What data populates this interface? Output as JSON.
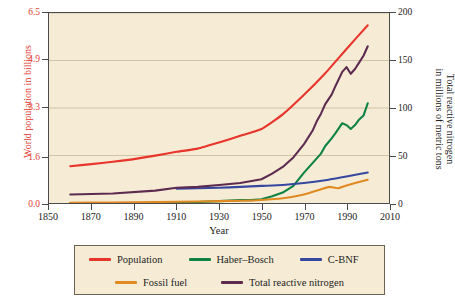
{
  "chart_data": {
    "type": "line",
    "title": "",
    "xlabel": "Year",
    "ylabel_left": "World population in billions",
    "ylabel_right": "Total reactive nitrogen in millions of metric tons",
    "ylabel_right_line1": "Total reactive nitrogen",
    "ylabel_right_line2": "in millions of metric tons",
    "xlim": [
      1850,
      2010
    ],
    "ylim_left": [
      0.0,
      6.5
    ],
    "ylim_right": [
      0,
      200
    ],
    "xticks": [
      1850,
      1870,
      1890,
      1910,
      1930,
      1950,
      1970,
      1990,
      2010
    ],
    "yticks_left": [
      "0.0",
      "1.6",
      "3.3",
      "4.9",
      "6.5"
    ],
    "yticks_left_values": [
      0.0,
      1.6,
      3.3,
      4.9,
      6.5
    ],
    "yticks_right": [
      "0",
      "50",
      "100",
      "150",
      "200"
    ],
    "yticks_right_values": [
      0,
      50,
      100,
      150,
      200
    ],
    "grid": "horizontal",
    "legend_position": "below",
    "plot_background": "#f6ecd6",
    "series": [
      {
        "name": "Population",
        "color": "#e8352b",
        "axis": "left",
        "units": "billions",
        "x": [
          1860,
          1870,
          1880,
          1890,
          1900,
          1910,
          1920,
          1930,
          1940,
          1950,
          1960,
          1970,
          1980,
          1990,
          2000
        ],
        "values": [
          1.26,
          1.33,
          1.41,
          1.5,
          1.62,
          1.75,
          1.86,
          2.07,
          2.3,
          2.53,
          3.03,
          3.7,
          4.44,
          5.27,
          6.08
        ]
      },
      {
        "name": "Haber–Bosch",
        "color": "#0c8243",
        "axis": "right",
        "units": "Mt N",
        "x": [
          1860,
          1900,
          1913,
          1920,
          1930,
          1940,
          1945,
          1950,
          1955,
          1960,
          1965,
          1970,
          1974,
          1978,
          1980,
          1983,
          1985,
          1988,
          1990,
          1992,
          1994,
          1996,
          1998,
          2000
        ],
        "values": [
          0,
          0,
          0.5,
          1,
          2,
          3,
          3,
          4,
          7,
          11,
          18,
          32,
          42,
          52,
          60,
          68,
          74,
          84,
          82,
          78,
          82,
          88,
          92,
          105
        ]
      },
      {
        "name": "C-BNF",
        "color": "#36479f",
        "axis": "right",
        "units": "Mt N",
        "x": [
          1910,
          1920,
          1930,
          1940,
          1950,
          1960,
          1970,
          1980,
          1990,
          2000
        ],
        "values": [
          15,
          15.5,
          16,
          17,
          18,
          19,
          21,
          24,
          28,
          32
        ]
      },
      {
        "name": "Fossil fuel",
        "color": "#e08a21",
        "axis": "right",
        "units": "Mt N",
        "x": [
          1860,
          1880,
          1900,
          1920,
          1940,
          1950,
          1960,
          1970,
          1978,
          1982,
          1986,
          1990,
          2000
        ],
        "values": [
          0.3,
          0.6,
          1.0,
          1.6,
          2.4,
          3.2,
          5.0,
          9.0,
          14.5,
          17.0,
          15.5,
          18.5,
          24.5
        ]
      },
      {
        "name": "Total reactive nitrogen",
        "color": "#5e2b50",
        "axis": "right",
        "units": "Mt N",
        "x": [
          1860,
          1880,
          1900,
          1910,
          1920,
          1930,
          1940,
          1950,
          1955,
          1960,
          1965,
          1970,
          1974,
          1976,
          1978,
          1980,
          1983,
          1985,
          1988,
          1990,
          1992,
          1994,
          1996,
          1998,
          2000
        ],
        "values": [
          9,
          10,
          13,
          16,
          17,
          19,
          21,
          25,
          31,
          38,
          48,
          62,
          76,
          86,
          94,
          104,
          114,
          124,
          138,
          143,
          136,
          141,
          148,
          155,
          165
        ]
      }
    ]
  },
  "legend": {
    "row1": [
      {
        "label": "Population",
        "color": "#e8352b"
      },
      {
        "label": "Haber–Bosch",
        "color": "#0c8243"
      },
      {
        "label": "C-BNF",
        "color": "#36479f"
      }
    ],
    "row2": [
      {
        "label": "Fossil fuel",
        "color": "#e08a21"
      },
      {
        "label": "Total reactive nitrogen",
        "color": "#5e2b50"
      }
    ]
  }
}
